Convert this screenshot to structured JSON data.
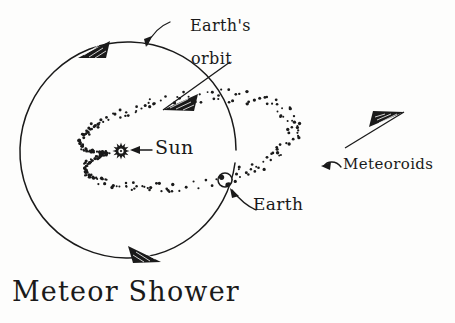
{
  "title": "Meteor Shower",
  "background_color": "#fdfdfc",
  "ink_color": "#1a1a1a",
  "labels": {
    "earths_orbit_line1": "Earth's",
    "earths_orbit_line2": "orbit",
    "sun": "Sun",
    "earth": "Earth",
    "meteoroids": "Meteoroids"
  },
  "diagram": {
    "earth_orbit": {
      "shape": "circle",
      "center_x": 128,
      "center_y": 150,
      "radius": 108,
      "direction_arrows": 3
    },
    "sun": {
      "x": 121,
      "y": 151,
      "glyph": "starburst"
    },
    "earth": {
      "x": 225,
      "y": 180,
      "radius": 7,
      "glyph": "globe"
    },
    "meteoroid_stream": {
      "shape": "elongated-ellipse-loop",
      "style": "stippled-dots",
      "dot_count": 210,
      "direction_arrows": 2
    }
  }
}
